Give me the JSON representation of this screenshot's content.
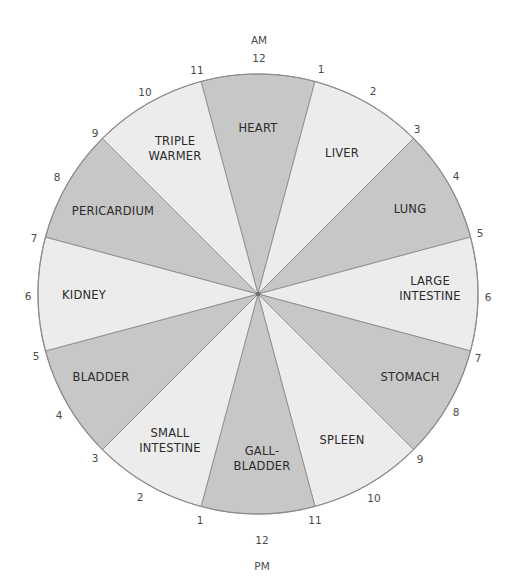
{
  "diagram": {
    "center": [
      258,
      294
    ],
    "radius": 220,
    "colors": {
      "dark": "#c7c7c7",
      "light": "#ececec",
      "border": "#8c8c8c",
      "text": "#2b2b2b",
      "hour_text": "#4a4a4a"
    },
    "period_labels": {
      "top": {
        "text": "AM",
        "x": 259,
        "y": 44
      },
      "bottom": {
        "text": "PM",
        "x": 262,
        "y": 570
      }
    },
    "sectors": [
      {
        "id": "heart",
        "lines": [
          "HEART"
        ],
        "center_angle": 0,
        "shade": "dark",
        "label_x": 258,
        "label_y": 132,
        "time": "11 AM - 1 PM"
      },
      {
        "id": "liver",
        "lines": [
          "LIVER"
        ],
        "center_angle": 30,
        "shade": "light",
        "label_x": 342,
        "label_y": 157,
        "time": "1 AM - 3 AM"
      },
      {
        "id": "lung",
        "lines": [
          "LUNG"
        ],
        "center_angle": 60,
        "shade": "dark",
        "label_x": 410,
        "label_y": 213,
        "time": "3 AM - 5 AM"
      },
      {
        "id": "large-intestine",
        "lines": [
          "LARGE",
          "INTESTINE"
        ],
        "center_angle": 90,
        "shade": "light",
        "label_x": 430,
        "label_y": 292,
        "time": "5 AM - 7 AM"
      },
      {
        "id": "stomach",
        "lines": [
          "STOMACH"
        ],
        "center_angle": 120,
        "shade": "dark",
        "label_x": 410,
        "label_y": 381,
        "time": "7 AM - 9 AM"
      },
      {
        "id": "spleen",
        "lines": [
          "SPLEEN"
        ],
        "center_angle": 150,
        "shade": "light",
        "label_x": 342,
        "label_y": 444,
        "time": "9 AM - 11 AM"
      },
      {
        "id": "gallbladder",
        "lines": [
          "GALL-",
          "BLADDER"
        ],
        "center_angle": 180,
        "shade": "dark",
        "label_x": 262,
        "label_y": 462,
        "time": "11 PM - 1 AM"
      },
      {
        "id": "small-intestine",
        "lines": [
          "SMALL",
          "INTESTINE"
        ],
        "center_angle": 210,
        "shade": "light",
        "label_x": 170,
        "label_y": 444,
        "time": "1 PM - 3 PM"
      },
      {
        "id": "bladder",
        "lines": [
          "BLADDER"
        ],
        "center_angle": 240,
        "shade": "dark",
        "label_x": 101,
        "label_y": 381,
        "time": "3 PM - 5 PM"
      },
      {
        "id": "kidney",
        "lines": [
          "KIDNEY"
        ],
        "center_angle": 270,
        "shade": "light",
        "label_x": 84,
        "label_y": 299,
        "time": "5 PM - 7 PM"
      },
      {
        "id": "pericardium",
        "lines": [
          "PERICARDIUM"
        ],
        "center_angle": 300,
        "shade": "dark",
        "label_x": 113,
        "label_y": 215,
        "time": "7 PM - 9 PM"
      },
      {
        "id": "triple-warmer",
        "lines": [
          "TRIPLE",
          "WARMER"
        ],
        "center_angle": 330,
        "shade": "light",
        "label_x": 175,
        "label_y": 152,
        "time": "9 PM - 11 PM"
      }
    ],
    "hour_marks": [
      {
        "text": "12",
        "x": 259,
        "y": 62
      },
      {
        "text": "1",
        "x": 321,
        "y": 73
      },
      {
        "text": "2",
        "x": 373,
        "y": 95
      },
      {
        "text": "3",
        "x": 417,
        "y": 133
      },
      {
        "text": "4",
        "x": 456,
        "y": 180
      },
      {
        "text": "5",
        "x": 480,
        "y": 237
      },
      {
        "text": "6",
        "x": 488,
        "y": 301
      },
      {
        "text": "7",
        "x": 478,
        "y": 362
      },
      {
        "text": "8",
        "x": 456,
        "y": 416
      },
      {
        "text": "9",
        "x": 420,
        "y": 463
      },
      {
        "text": "10",
        "x": 374,
        "y": 502
      },
      {
        "text": "11",
        "x": 315,
        "y": 524
      },
      {
        "text": "12",
        "x": 262,
        "y": 544
      },
      {
        "text": "1",
        "x": 200,
        "y": 524
      },
      {
        "text": "2",
        "x": 140,
        "y": 501
      },
      {
        "text": "3",
        "x": 95,
        "y": 462
      },
      {
        "text": "4",
        "x": 59,
        "y": 419
      },
      {
        "text": "5",
        "x": 36,
        "y": 360
      },
      {
        "text": "6",
        "x": 28,
        "y": 300
      },
      {
        "text": "7",
        "x": 34,
        "y": 242
      },
      {
        "text": "8",
        "x": 57,
        "y": 181
      },
      {
        "text": "9",
        "x": 95,
        "y": 137
      },
      {
        "text": "10",
        "x": 145,
        "y": 96
      },
      {
        "text": "11",
        "x": 197,
        "y": 74
      }
    ]
  }
}
